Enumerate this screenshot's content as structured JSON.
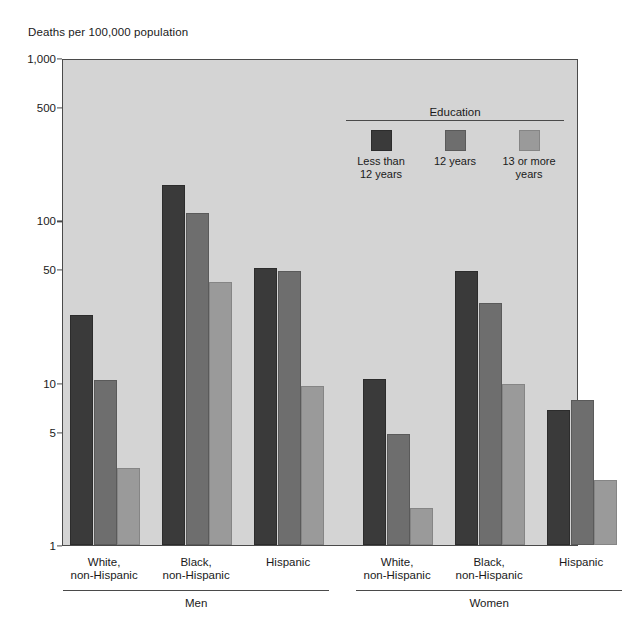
{
  "chart_data": {
    "type": "bar",
    "title": "",
    "ylabel": "Deaths per 100,000 population",
    "xlabel": "",
    "scale": "log",
    "ylim": [
      1,
      1000
    ],
    "yticks": [
      "1",
      "5",
      "10",
      "50",
      "100",
      "500",
      "1,000"
    ],
    "ytick_values": [
      1,
      5,
      10,
      50,
      100,
      500,
      1000
    ],
    "grid": false,
    "legend_title": "Education",
    "legend_position": "upper-right-inside",
    "series": [
      {
        "name": "Less than 12 years",
        "color": "#3a3a3a",
        "values": [
          26,
          166,
          51,
          10.6,
          49,
          6.8
        ]
      },
      {
        "name": "12 years",
        "color": "#6e6e6e",
        "values": [
          10.4,
          111,
          49,
          4.8,
          31,
          7.8
        ]
      },
      {
        "name": "13 or more years",
        "color": "#9a9a9a",
        "values": [
          3.0,
          42,
          9.5,
          1.7,
          9.8,
          2.5
        ]
      }
    ],
    "categories": [
      "White, non-Hispanic",
      "Black, non-Hispanic",
      "Hispanic",
      "White, non-Hispanic",
      "Black, non-Hispanic",
      "Hispanic"
    ],
    "category_lines": [
      [
        "White,",
        "non-Hispanic"
      ],
      [
        "Black,",
        "non-Hispanic"
      ],
      [
        "Hispanic",
        ""
      ],
      [
        "White,",
        "non-Hispanic"
      ],
      [
        "Black,",
        "non-Hispanic"
      ],
      [
        "Hispanic",
        ""
      ]
    ],
    "supergroups": [
      {
        "label": "Men",
        "categories": [
          0,
          1,
          2
        ]
      },
      {
        "label": "Women",
        "categories": [
          3,
          4,
          5
        ]
      }
    ]
  },
  "legend": {
    "title": "Education",
    "items": [
      {
        "label_line1": "Less than",
        "label_line2": "12 years",
        "color": "#3a3a3a"
      },
      {
        "label_line1": "12 years",
        "label_line2": "",
        "color": "#6e6e6e"
      },
      {
        "label_line1": "13 or more",
        "label_line2": "years",
        "color": "#9a9a9a"
      }
    ]
  },
  "axis": {
    "y_title": "Deaths per 100,000 population"
  }
}
